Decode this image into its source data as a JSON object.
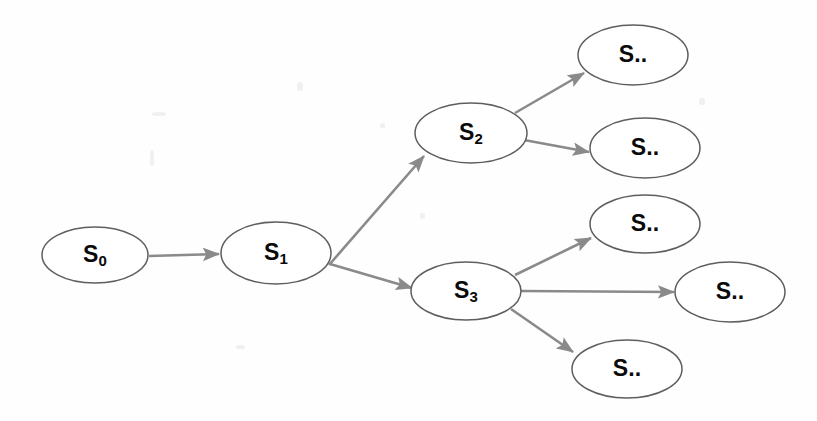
{
  "diagram": {
    "type": "directed-tree",
    "style": {
      "node_fill": "#ffffff",
      "node_stroke": "#5e5e5e",
      "edge_stroke": "#8a8a8a",
      "label_color": "#0a0a0a",
      "background": "#fefefe"
    },
    "nodes": [
      {
        "id": "s0",
        "base": "S",
        "subscript": "0",
        "full_label": "S0",
        "cx": 95,
        "cy": 255,
        "rx": 53,
        "ry": 28
      },
      {
        "id": "s1",
        "base": "S",
        "subscript": "1",
        "full_label": "S1",
        "cx": 276,
        "cy": 253,
        "rx": 55,
        "ry": 31
      },
      {
        "id": "s2",
        "base": "S",
        "subscript": "2",
        "full_label": "S2",
        "cx": 471,
        "cy": 133,
        "rx": 56,
        "ry": 30
      },
      {
        "id": "s3",
        "base": "S",
        "subscript": "3",
        "full_label": "S3",
        "cx": 466,
        "cy": 291,
        "rx": 55,
        "ry": 29
      },
      {
        "id": "leaf1",
        "base": "S..",
        "subscript": "",
        "full_label": "S..",
        "cx": 633,
        "cy": 55,
        "rx": 55,
        "ry": 30
      },
      {
        "id": "leaf2",
        "base": "S..",
        "subscript": "",
        "full_label": "S..",
        "cx": 645,
        "cy": 148,
        "rx": 55,
        "ry": 30
      },
      {
        "id": "leaf3",
        "base": "S..",
        "subscript": "",
        "full_label": "S..",
        "cx": 645,
        "cy": 224,
        "rx": 55,
        "ry": 29
      },
      {
        "id": "leaf4",
        "base": "S..",
        "subscript": "",
        "full_label": "S..",
        "cx": 730,
        "cy": 292,
        "rx": 55,
        "ry": 30
      },
      {
        "id": "leaf5",
        "base": "S..",
        "subscript": "",
        "full_label": "S..",
        "cx": 627,
        "cy": 369,
        "rx": 55,
        "ry": 29
      }
    ],
    "edges": [
      {
        "id": "e0",
        "from": "s0",
        "to": "s1",
        "x1": 149,
        "y1": 256,
        "x2": 219,
        "y2": 254
      },
      {
        "id": "e1",
        "from": "s1",
        "to": "s2",
        "x1": 329,
        "y1": 265,
        "x2": 424,
        "y2": 156
      },
      {
        "id": "e2",
        "from": "s1",
        "to": "s3",
        "x1": 330,
        "y1": 264,
        "x2": 412,
        "y2": 288
      },
      {
        "id": "e3",
        "from": "s2",
        "to": "leaf1",
        "x1": 515,
        "y1": 113,
        "x2": 584,
        "y2": 73
      },
      {
        "id": "e4",
        "from": "s2",
        "to": "leaf2",
        "x1": 524,
        "y1": 140,
        "x2": 589,
        "y2": 152
      },
      {
        "id": "e5",
        "from": "s3",
        "to": "leaf3",
        "x1": 515,
        "y1": 275,
        "x2": 591,
        "y2": 238
      },
      {
        "id": "e6",
        "from": "s3",
        "to": "leaf4",
        "x1": 521,
        "y1": 291,
        "x2": 674,
        "y2": 292
      },
      {
        "id": "e7",
        "from": "s3",
        "to": "leaf5",
        "x1": 511,
        "y1": 309,
        "x2": 573,
        "y2": 352
      }
    ]
  }
}
